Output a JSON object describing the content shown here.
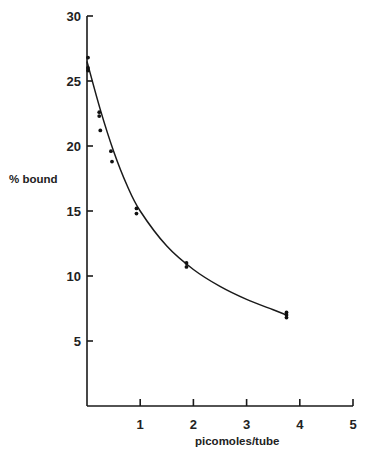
{
  "chart_data": {
    "type": "scatter",
    "title": "",
    "xlabel": "picomoles/tube",
    "ylabel": "% bound",
    "xlim": [
      0,
      5
    ],
    "ylim": [
      0,
      30
    ],
    "x_ticks": [
      1,
      2,
      3,
      4,
      5
    ],
    "y_ticks": [
      5,
      10,
      15,
      20,
      25,
      30
    ],
    "grid": false,
    "legend": null,
    "series": [
      {
        "name": "measured",
        "kind": "points",
        "x": [
          0.0,
          0.0,
          0.0,
          0.23,
          0.23,
          0.25,
          0.45,
          0.47,
          0.93,
          0.93,
          1.87,
          1.87,
          3.75,
          3.75,
          3.75
        ],
        "y": [
          26.8,
          26.0,
          25.8,
          22.6,
          22.3,
          21.2,
          19.6,
          18.8,
          15.2,
          14.8,
          11.0,
          10.7,
          7.2,
          7.0,
          6.8
        ]
      },
      {
        "name": "fitted curve",
        "kind": "line",
        "x": [
          0,
          0.25,
          0.5,
          0.75,
          1.0,
          1.5,
          2.0,
          2.5,
          3.0,
          3.5,
          3.75
        ],
        "y": [
          26.5,
          22.8,
          19.6,
          17.0,
          15.0,
          12.3,
          10.5,
          9.2,
          8.2,
          7.4,
          7.0
        ]
      }
    ]
  }
}
